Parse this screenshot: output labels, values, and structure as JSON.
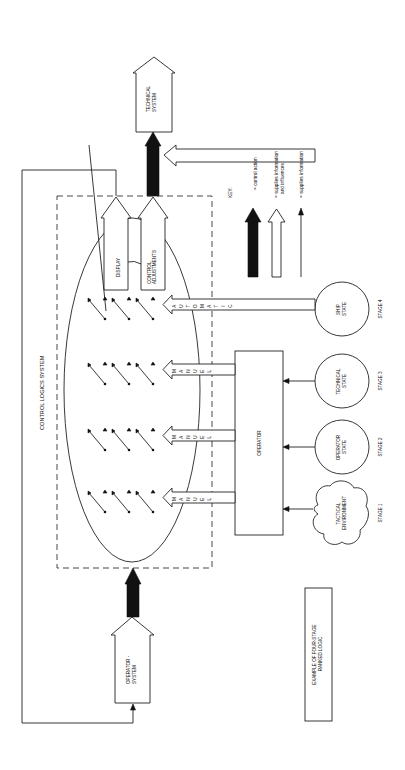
{
  "diagram": {
    "title": "EXAMPLE OF FOUR-STAGE RANKED LOGIC",
    "title_lines": [
      "EXAMPLE OF FOUR-STAGE",
      "RANKED LOGIC"
    ],
    "orientation": "rotated 90° counter-clockwise (landscape printed in portrait)",
    "nodes": {
      "technical_system": {
        "lines": [
          "TECHNICAL",
          "SYSTEM"
        ]
      },
      "operator_system": {
        "lines": [
          "OPERATOR -",
          "SYSTEM"
        ]
      },
      "control_logics_system": {
        "label": "CONTROL LOGICS SYSTEM"
      },
      "operator": {
        "label": "OPERATOR"
      },
      "display": {
        "label": "DISPLAY"
      },
      "control_adjustments": {
        "lines": [
          "CONTROL",
          "ADJUSTMENTS"
        ]
      },
      "ship_state": {
        "lines": [
          "SHIP",
          "STATE"
        ]
      },
      "technical_state": {
        "lines": [
          "TECHNICAL",
          "STATE"
        ]
      },
      "operator_state": {
        "lines": [
          "OPERATOR",
          "STATE"
        ]
      },
      "tactical_environment": {
        "lines": [
          "TACTICAL",
          "ENVIRONMENT"
        ]
      }
    },
    "stages": [
      {
        "label": "STAGE 1",
        "source": "TACTICAL ENVIRONMENT",
        "mode": "MANUEL"
      },
      {
        "label": "STAGE 2",
        "source": "OPERATOR STATE",
        "mode": "MANUEL"
      },
      {
        "label": "STAGE 3",
        "source": "TECHNICAL STATE",
        "mode": "MANUEL"
      },
      {
        "label": "STAGE 4",
        "source": "SHIP STATE",
        "mode": "AUTOMATIC"
      }
    ],
    "mode_letters": {
      "manual": [
        "M",
        "A",
        "N",
        "U",
        "E",
        "L"
      ],
      "automatic": [
        "A",
        "U",
        "T",
        "O",
        "M",
        "A",
        "T",
        "I",
        "C"
      ]
    },
    "key": {
      "title": "KEY:",
      "items": [
        {
          "symbol": "solid-black-arrow",
          "text": "= control action"
        },
        {
          "symbol": "hollow-arrow",
          "text_lines": [
            "= supplies information",
            "and influences"
          ]
        },
        {
          "symbol": "thin-arrow",
          "text": "= supplies information"
        }
      ]
    },
    "colors": {
      "ink": "#111111",
      "paper": "#ffffff"
    }
  }
}
